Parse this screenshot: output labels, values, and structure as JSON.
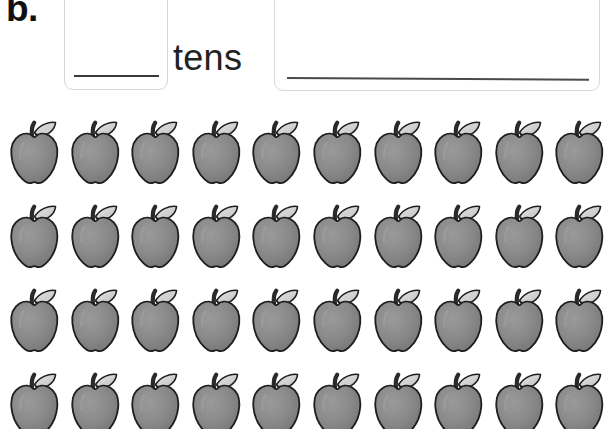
{
  "worksheet": {
    "problem_label": "b.",
    "tens_label": "tens",
    "tens_box": {
      "name": "tens-answer-box",
      "value": "",
      "placeholder": ""
    },
    "total_box": {
      "name": "total-answer-box",
      "value": "",
      "placeholder": ""
    }
  },
  "apples": {
    "icon_name": "apple-icon",
    "rows": 4,
    "per_row": 10,
    "total": 40,
    "body_color": "#8a8a8a",
    "outline_color": "#1e1e1e",
    "leaf_color": "#d5d5d5",
    "stem_color": "#2a2a2a",
    "row_counts": [
      10,
      10,
      10,
      10
    ]
  },
  "colors": {
    "background": "#ffffff",
    "box_border": "#d7d7d7",
    "answer_line": "#3a3a3a",
    "text": "#111111"
  }
}
